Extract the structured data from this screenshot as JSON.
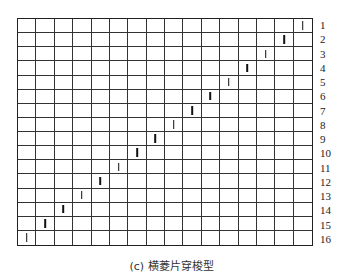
{
  "diagram": {
    "type": "grid-pattern",
    "rows": 16,
    "columns": 16,
    "row_labels": [
      "1",
      "2",
      "3",
      "4",
      "5",
      "6",
      "7",
      "8",
      "9",
      "10",
      "11",
      "12",
      "13",
      "14",
      "15",
      "16"
    ],
    "marks": [
      {
        "row": 1,
        "col": 16
      },
      {
        "row": 2,
        "col": 15
      },
      {
        "row": 3,
        "col": 14
      },
      {
        "row": 4,
        "col": 13
      },
      {
        "row": 5,
        "col": 12
      },
      {
        "row": 6,
        "col": 11
      },
      {
        "row": 7,
        "col": 10
      },
      {
        "row": 8,
        "col": 9
      },
      {
        "row": 9,
        "col": 8
      },
      {
        "row": 10,
        "col": 7
      },
      {
        "row": 11,
        "col": 6
      },
      {
        "row": 12,
        "col": 5
      },
      {
        "row": 13,
        "col": 4
      },
      {
        "row": 14,
        "col": 3
      },
      {
        "row": 15,
        "col": 2
      },
      {
        "row": 16,
        "col": 1
      }
    ],
    "mark_glyph": "vertical-bar",
    "caption": "(c) 横菱片穿梭型"
  }
}
